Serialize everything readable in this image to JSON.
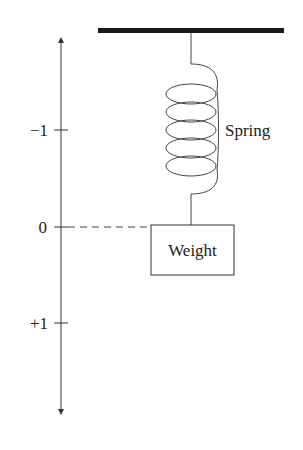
{
  "diagram": {
    "axis": {
      "ticks": [
        {
          "label": "−1",
          "value": -1
        },
        {
          "label": "0",
          "value": 0
        },
        {
          "label": "+1",
          "value": 1
        }
      ]
    },
    "labels": {
      "spring": "Spring",
      "weight": "Weight"
    },
    "colors": {
      "stroke": "#333333",
      "ceiling": "#1a1a1a"
    }
  }
}
